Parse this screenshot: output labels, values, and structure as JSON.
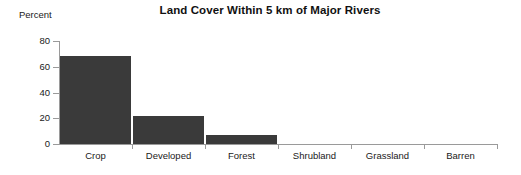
{
  "chart_data": {
    "type": "bar",
    "title": "Land Cover Within 5 km of Major Rivers",
    "xlabel": "",
    "ylabel": "Percent",
    "categories": [
      "Crop",
      "Developed",
      "Forest",
      "Shrubland",
      "Grassland",
      "Barren"
    ],
    "values": [
      68,
      22,
      7,
      0,
      0,
      0
    ],
    "ylim": [
      0,
      80
    ],
    "yticks": [
      0,
      20,
      40,
      60,
      80
    ],
    "ytick_labels": [
      "0",
      "20",
      "40",
      "60",
      "80"
    ],
    "grid": false,
    "legend": false,
    "bar_color": "#3a3a3a",
    "axis_color": "#9a9a9a",
    "background": "#ffffff"
  },
  "axis": {
    "y_title": "Percent",
    "tick_labels": [
      "80",
      "60",
      "40",
      "20",
      "0"
    ]
  }
}
